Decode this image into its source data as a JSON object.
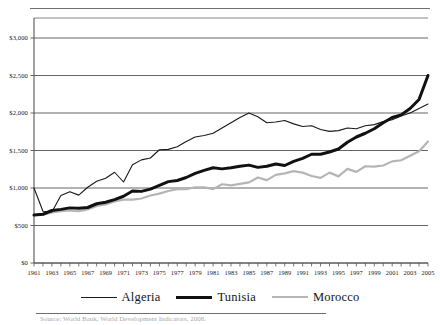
{
  "figure": {
    "source_note": "Source: World Bank, World Development Indicators, 2008."
  },
  "chart_data": {
    "type": "line",
    "title": "",
    "xlabel": "",
    "ylabel": "",
    "grid": true,
    "legend_position": "bottom",
    "ylim": [
      0,
      3000
    ],
    "ytick_values": [
      0,
      500,
      1000,
      1500,
      2000,
      2500,
      3000
    ],
    "ytick_labels": [
      "$0",
      "$500",
      "$1,000",
      "$1,500",
      "$2,000",
      "$2,500",
      "$3,000"
    ],
    "xlim": [
      1961,
      2005
    ],
    "x": [
      1961,
      1962,
      1963,
      1964,
      1965,
      1966,
      1967,
      1968,
      1969,
      1970,
      1971,
      1972,
      1973,
      1974,
      1975,
      1976,
      1977,
      1978,
      1979,
      1980,
      1981,
      1982,
      1983,
      1984,
      1985,
      1986,
      1987,
      1988,
      1989,
      1990,
      1991,
      1992,
      1993,
      1994,
      1995,
      1996,
      1997,
      1998,
      1999,
      2000,
      2001,
      2002,
      2003,
      2004,
      2005
    ],
    "xtick_labels": [
      "1961",
      "1963",
      "1965",
      "1967",
      "1969",
      "1971",
      "1973",
      "1975",
      "1977",
      "1979",
      "1981",
      "1983",
      "1985",
      "1987",
      "1989",
      "1991",
      "1993",
      "1995",
      "1997",
      "1999",
      "2001",
      "2003",
      "2005"
    ],
    "series": [
      {
        "name": "Algeria",
        "color": "#1a1a1a",
        "width": 1.1,
        "values": [
          1000,
          690,
          680,
          900,
          950,
          905,
          1010,
          1090,
          1130,
          1210,
          1080,
          1310,
          1375,
          1400,
          1510,
          1515,
          1550,
          1620,
          1680,
          1700,
          1730,
          1800,
          1870,
          1940,
          2000,
          1950,
          1870,
          1880,
          1900,
          1855,
          1820,
          1830,
          1780,
          1755,
          1765,
          1800,
          1790,
          1830,
          1845,
          1885,
          1910,
          1960,
          2000,
          2060,
          2120
        ]
      },
      {
        "name": "Tunisia",
        "color": "#111111",
        "width": 3.0,
        "values": [
          640,
          650,
          700,
          715,
          735,
          730,
          740,
          790,
          810,
          845,
          890,
          960,
          955,
          985,
          1035,
          1085,
          1100,
          1140,
          1195,
          1235,
          1270,
          1255,
          1270,
          1290,
          1305,
          1275,
          1290,
          1320,
          1300,
          1355,
          1395,
          1450,
          1450,
          1480,
          1520,
          1610,
          1680,
          1730,
          1790,
          1870,
          1940,
          1975,
          2060,
          2180,
          2500
        ]
      },
      {
        "name": "Morocco",
        "color": "#b5b5b5",
        "width": 2.2,
        "values": [
          640,
          645,
          675,
          690,
          700,
          690,
          715,
          760,
          780,
          820,
          845,
          845,
          860,
          900,
          925,
          960,
          985,
          985,
          1010,
          1010,
          985,
          1050,
          1035,
          1055,
          1075,
          1140,
          1105,
          1175,
          1195,
          1225,
          1205,
          1160,
          1135,
          1205,
          1155,
          1255,
          1215,
          1290,
          1285,
          1300,
          1355,
          1370,
          1430,
          1490,
          1620
        ]
      }
    ]
  }
}
